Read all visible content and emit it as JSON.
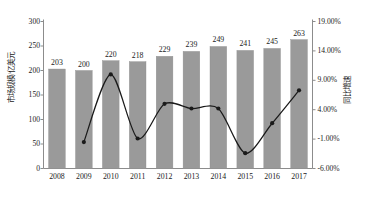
{
  "chart_data": {
    "type": "bar",
    "title": "",
    "categories": [
      "2008",
      "2009",
      "2010",
      "2011",
      "2012",
      "2013",
      "2014",
      "2015",
      "2016",
      "2017"
    ],
    "values": [
      203,
      200,
      220,
      218,
      229,
      239,
      249,
      241,
      245,
      263
    ],
    "bar_labels": [
      "203",
      "200",
      "220",
      "218",
      "229",
      "239",
      "249",
      "241",
      "245",
      "263"
    ],
    "ylabel": "市场规模/亿美元",
    "ylabel_right": "同比增速",
    "xlabel": "",
    "ylim": [
      0,
      300
    ],
    "ylim_right": [
      -6,
      19
    ],
    "yticks": [
      "0",
      "50",
      "100",
      "150",
      "200",
      "250",
      "300"
    ],
    "ytick_values": [
      0,
      50,
      100,
      150,
      200,
      250,
      300
    ],
    "yticks_right": [
      "-6.00%",
      "-1.00%",
      "4.00%",
      "9.00%",
      "14.00%",
      "19.00%"
    ],
    "ytick_values_right": [
      -6,
      -1,
      4,
      9,
      14,
      19
    ],
    "grid": false,
    "legend_position": "below",
    "series": [
      {
        "name": "市场规模/亿美元",
        "type": "bar",
        "color": "#9a9a9a",
        "values": [
          203,
          200,
          220,
          218,
          229,
          239,
          249,
          241,
          245,
          263
        ]
      },
      {
        "name": "同比增速",
        "type": "line",
        "color": "#1a1a1a",
        "axis": "right",
        "x": [
          "2009",
          "2010",
          "2011",
          "2012",
          "2013",
          "2014",
          "2015",
          "2016",
          "2017"
        ],
        "values": [
          -1.5,
          10.0,
          -0.9,
          5.0,
          4.2,
          4.2,
          -3.4,
          1.7,
          7.3
        ]
      }
    ]
  },
  "axes": {
    "left_title": "市场规模/亿美元",
    "right_title": "同比增速"
  },
  "caption": {
    "text": ""
  },
  "colors": {
    "bar": "#9a9a9a",
    "line": "#1a1a1a",
    "axis": "#8c8c8c",
    "text": "#1a1a1a"
  }
}
